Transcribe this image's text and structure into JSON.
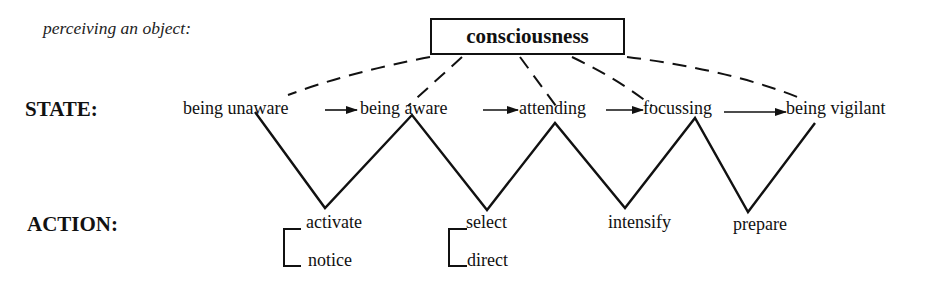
{
  "caption": "perceiving an object:",
  "root": {
    "label": "consciousness"
  },
  "rows": {
    "state_label": "STATE:",
    "action_label": "ACTION:"
  },
  "states": [
    {
      "label": "being unaware"
    },
    {
      "label": "being aware"
    },
    {
      "label": "attending"
    },
    {
      "label": "focussing"
    },
    {
      "label": "being vigilant"
    }
  ],
  "actions": [
    {
      "label": "activate",
      "sub": "notice",
      "bracketed": true
    },
    {
      "label": "select",
      "sub": "direct",
      "bracketed": true
    },
    {
      "label": "intensify"
    },
    {
      "label": "prepare"
    }
  ],
  "edges": {
    "state_transitions": "solid arrows between consecutive states",
    "consciousness_links": "dashed lines from consciousness to each state",
    "zigzag": "solid zigzag linking states (top) to actions (bottom)"
  },
  "colors": {
    "ink": "#111111",
    "background": "#ffffff"
  }
}
